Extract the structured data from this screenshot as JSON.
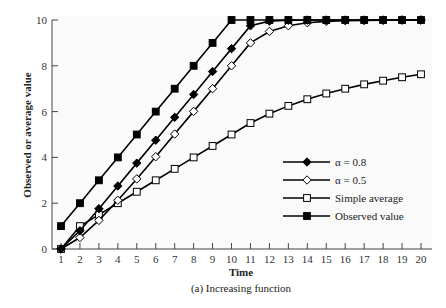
{
  "chart_data": {
    "type": "line",
    "title": "",
    "caption": "(a) Increasing function",
    "xlabel": "Time",
    "ylabel": "Observed or average value",
    "x": [
      1,
      2,
      3,
      4,
      5,
      6,
      7,
      8,
      9,
      10,
      11,
      12,
      13,
      14,
      15,
      16,
      17,
      18,
      19,
      20
    ],
    "xlim": [
      1,
      20
    ],
    "ylim": [
      0,
      10
    ],
    "yticks": [
      0,
      2,
      4,
      6,
      8,
      10
    ],
    "grid": false,
    "legend_position": "lower right (inside)",
    "series": [
      {
        "name": "α = 0.8",
        "marker": "filled-diamond",
        "values": [
          0,
          0.8,
          1.76,
          2.75,
          3.75,
          4.75,
          5.75,
          6.75,
          7.75,
          8.75,
          9.75,
          9.95,
          9.99,
          10,
          10,
          10,
          10,
          10,
          10,
          10
        ]
      },
      {
        "name": "α = 0.5",
        "marker": "open-diamond",
        "values": [
          0,
          0.5,
          1.25,
          2.13,
          3.06,
          4.03,
          5.02,
          6.01,
          7.0,
          8.0,
          9.0,
          9.5,
          9.75,
          9.88,
          9.94,
          9.97,
          9.98,
          9.99,
          10,
          10
        ]
      },
      {
        "name": "Simple average",
        "marker": "open-square",
        "values": [
          0,
          1,
          1.5,
          2,
          2.5,
          3,
          3.5,
          4,
          4.5,
          5,
          5.5,
          5.91,
          6.25,
          6.54,
          6.79,
          7.0,
          7.19,
          7.35,
          7.5,
          7.63
        ]
      },
      {
        "name": "Observed value",
        "marker": "filled-square",
        "values": [
          1,
          2,
          3,
          4,
          5,
          6,
          7,
          8,
          9,
          10,
          10,
          10,
          10,
          10,
          10,
          10,
          10,
          10,
          10,
          10
        ]
      }
    ]
  },
  "labels": {
    "xlabel": "Time",
    "ylabel": "Observed or average value",
    "caption": "(a) Increasing function",
    "legend": [
      "α = 0.8",
      "α = 0.5",
      "Simple average",
      "Observed value"
    ]
  }
}
